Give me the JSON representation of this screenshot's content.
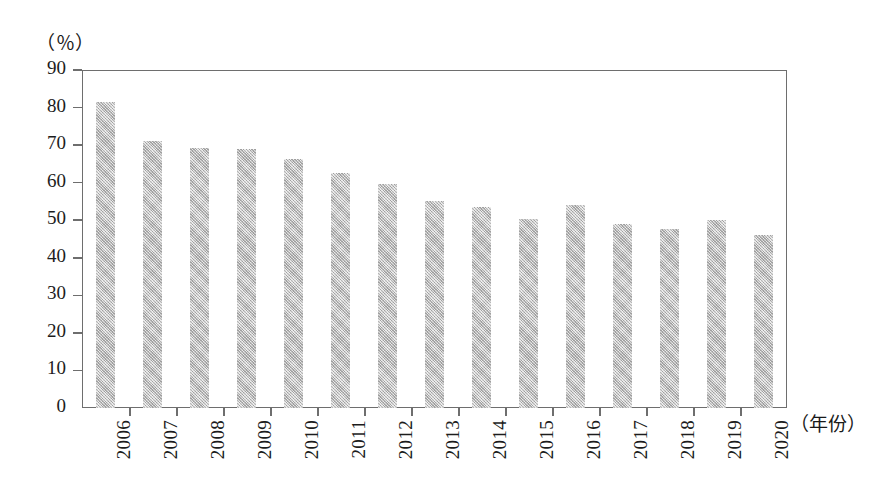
{
  "chart_data": {
    "type": "bar",
    "title": "",
    "subtitle": "",
    "xlabel": "（年份）",
    "ylabel": "（％）",
    "ylim": [
      0,
      90
    ],
    "grid": false,
    "legend": null,
    "categories": [
      "2006",
      "2007",
      "2008",
      "2009",
      "2010",
      "2011",
      "2012",
      "2013",
      "2014",
      "2015",
      "2016",
      "2017",
      "2018",
      "2019",
      "2020"
    ],
    "values": [
      81.5,
      71.0,
      69.3,
      69.0,
      66.3,
      62.5,
      59.7,
      55.2,
      53.5,
      50.3,
      54.0,
      49.0,
      47.8,
      50.0,
      46.0
    ],
    "ytick_labels": [
      "90",
      "80",
      "70",
      "60",
      "50",
      "40",
      "30",
      "20",
      "10",
      "0"
    ],
    "ytick_values": [
      90,
      80,
      70,
      60,
      50,
      40,
      30,
      20,
      10,
      0
    ],
    "bar_color": "#bdbdbd",
    "axis_color": "#6e6e6e",
    "text_color": "#1c1c1c"
  },
  "axis": {
    "y_unit_caption": "（％）",
    "x_unit_caption": "（年份）"
  }
}
